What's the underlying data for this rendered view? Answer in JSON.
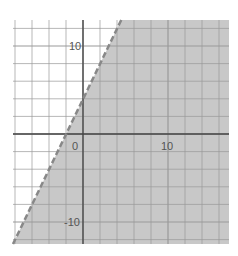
{
  "chart_data": {
    "type": "area",
    "title": "",
    "xlabel": "",
    "ylabel": "",
    "boundary": {
      "equation": "y = 2x + 4",
      "slope": 2,
      "intercept": 4,
      "style": "dashed"
    },
    "inequality": "y < 2x + 4",
    "shaded_side": "below-right",
    "xlim": [
      -8.2,
      17.2
    ],
    "ylim": [
      -12.5,
      13
    ],
    "grid": true,
    "grid_step": 2,
    "x_tick_labels": [
      {
        "value": 0,
        "label": "0"
      },
      {
        "value": 10,
        "label": "10"
      }
    ],
    "y_tick_labels": [
      {
        "value": 10,
        "label": "10"
      },
      {
        "value": -10,
        "label": "-10"
      }
    ],
    "points": [
      {
        "x": -2,
        "y": 0,
        "note": "x-intercept"
      },
      {
        "x": 0,
        "y": 4,
        "note": "y-intercept"
      }
    ]
  },
  "colors": {
    "shade": "#c8c8c8",
    "grid": "#999999",
    "axis": "#444444",
    "boundary": "#888888",
    "tick_text": "#555555"
  },
  "labels": {
    "x_origin": "0",
    "x_ten": "10",
    "y_ten": "10",
    "y_neg_ten": "-10"
  }
}
